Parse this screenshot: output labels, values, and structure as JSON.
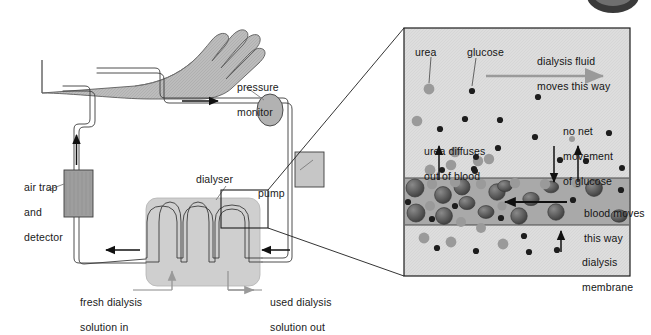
{
  "figure": {
    "background": "#ffffff"
  },
  "colors": {
    "outline": "#231f20",
    "skin_fill": "#b9b9b9",
    "tube_fill": "#ffffff",
    "tube_stroke": "#3b3b3b",
    "dialyser_fill": "#cdcdcd",
    "pump_fill": "#c4c4c4",
    "airtrap_fill": "#9c9c9c",
    "pressure_fill": "#b0b0b0",
    "panel_fill": "#dcdcdc",
    "blood_band_fill": "#a9a9a9",
    "membrane_line": "#4a4a4a",
    "urea_dot": "#9a9a9a",
    "glucose_dot": "#1d1d1d",
    "blood_cell": "#5c5c5c",
    "leader_grey": "#8c8c8c",
    "arrow_grey": "#9a9a9a",
    "arrow_black": "#111111"
  },
  "machine": {
    "labels": {
      "pressure_monitor": [
        "pressure",
        "monitor"
      ],
      "air_trap": [
        "air trap",
        "and",
        "detector"
      ],
      "dialyser": "dialyser",
      "pump": "pump",
      "fresh_solution": [
        "fresh dialysis",
        "solution in"
      ],
      "used_solution": [
        "used dialysis",
        "solution out"
      ]
    },
    "parts": [
      {
        "name": "arm",
        "label": ""
      },
      {
        "name": "pressure-monitor",
        "label": "pressure monitor"
      },
      {
        "name": "air-trap-and-detector",
        "label": "air trap and detector"
      },
      {
        "name": "dialyser",
        "label": "dialyser"
      },
      {
        "name": "pump",
        "label": "pump"
      },
      {
        "name": "blood-tubing",
        "label": ""
      }
    ],
    "flow_arrows": [
      {
        "name": "blood-out-to-pump",
        "direction": "right"
      },
      {
        "name": "blood-return-to-arm",
        "direction": "up"
      },
      {
        "name": "dialyser-inlet",
        "direction": "left"
      },
      {
        "name": "dialyser-outlet",
        "direction": "left"
      }
    ]
  },
  "detail_panel": {
    "labels": {
      "urea": "urea",
      "glucose": "glucose",
      "dialysis_fluid_flow": [
        "dialysis fluid",
        "moves this way"
      ],
      "urea_diffuses": [
        "urea diffuses",
        "out of blood"
      ],
      "no_net_movement": [
        "no net",
        "movement",
        "of glucose"
      ],
      "blood_moves": [
        "blood moves",
        "this way"
      ],
      "dialysis_membrane": [
        "dialysis",
        "membrane"
      ]
    },
    "legend": [
      {
        "name": "urea-particle",
        "label": "urea",
        "color": "#9a9a9a",
        "shape": "circle"
      },
      {
        "name": "glucose-particle",
        "label": "glucose",
        "color": "#1d1d1d",
        "shape": "circle"
      },
      {
        "name": "red-blood-cell",
        "label": "blood cell",
        "color": "#5c5c5c",
        "shape": "circle"
      }
    ],
    "regions": [
      {
        "name": "upper-dialysis-fluid",
        "label": "dialysis fluid"
      },
      {
        "name": "blood-channel",
        "label": "blood"
      },
      {
        "name": "lower-dialysis-fluid",
        "label": "dialysis fluid"
      }
    ],
    "arrows": [
      {
        "name": "dialysis-fluid-flow-arrow",
        "direction": "right",
        "color": "#9a9a9a"
      },
      {
        "name": "urea-diffusion-arrow",
        "direction": "up",
        "color": "#111111"
      },
      {
        "name": "glucose-in-arrow",
        "direction": "down",
        "color": "#111111"
      },
      {
        "name": "glucose-out-arrow",
        "direction": "up",
        "color": "#111111"
      },
      {
        "name": "blood-flow-arrow",
        "direction": "left",
        "color": "#111111"
      },
      {
        "name": "membrane-pointer-arrow",
        "direction": "up",
        "color": "#111111"
      }
    ]
  }
}
